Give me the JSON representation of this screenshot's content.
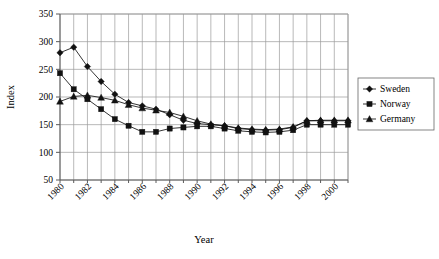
{
  "chart_data": {
    "type": "line",
    "title": "",
    "xlabel": "Year",
    "ylabel": "Index",
    "x": [
      1980,
      1981,
      1982,
      1983,
      1984,
      1985,
      1986,
      1987,
      1988,
      1989,
      1990,
      1991,
      1992,
      1993,
      1994,
      1995,
      1996,
      1997,
      1998,
      1999,
      2000,
      2001
    ],
    "xlim": [
      1980,
      2001
    ],
    "ylim": [
      50,
      350
    ],
    "yticks": [
      50,
      100,
      150,
      200,
      250,
      300,
      350
    ],
    "xticks": [
      1980,
      1982,
      1984,
      1986,
      1988,
      1990,
      1992,
      1994,
      1996,
      1998,
      2000
    ],
    "xtick_labels": [
      "1980",
      "1982",
      "1984",
      "1986",
      "1988",
      "1990",
      "1992",
      "1994",
      "1996",
      "1998",
      "2000"
    ],
    "ytick_labels": [
      "50",
      "100",
      "150",
      "200",
      "250",
      "300",
      "350"
    ],
    "grid": "both",
    "legend_position": "right",
    "series": [
      {
        "name": "Sweden",
        "marker": "diamond",
        "color": "#111111",
        "values": [
          280,
          290,
          255,
          228,
          205,
          190,
          184,
          178,
          168,
          158,
          152,
          150,
          148,
          143,
          141,
          140,
          141,
          145,
          157,
          157,
          157,
          157
        ]
      },
      {
        "name": "Norway",
        "marker": "square",
        "color": "#111111",
        "values": [
          243,
          214,
          196,
          178,
          160,
          148,
          137,
          137,
          143,
          145,
          147,
          147,
          143,
          139,
          137,
          136,
          137,
          140,
          150,
          150,
          150,
          150
        ]
      },
      {
        "name": "Germany",
        "marker": "triangle",
        "color": "#111111",
        "values": [
          192,
          201,
          203,
          199,
          194,
          186,
          180,
          176,
          172,
          165,
          157,
          151,
          148,
          144,
          142,
          141,
          142,
          146,
          157,
          158,
          158,
          158
        ]
      }
    ]
  },
  "legend": {
    "items": [
      {
        "label": "Sweden",
        "marker": "diamond"
      },
      {
        "label": "Norway",
        "marker": "square"
      },
      {
        "label": "Germany",
        "marker": "triangle"
      }
    ]
  },
  "axes": {
    "y_title": "Index",
    "x_title": "Year"
  }
}
